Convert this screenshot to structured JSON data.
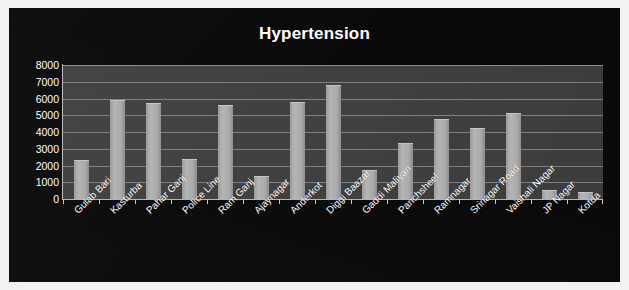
{
  "chart_data": {
    "type": "bar",
    "title": "Hypertension",
    "xlabel": "",
    "ylabel": "",
    "ylim": [
      0,
      8000
    ],
    "ytick_step": 1000,
    "yticks": [
      "8000",
      "7000",
      "6000",
      "5000",
      "4000",
      "3000",
      "2000",
      "1000",
      "0"
    ],
    "grid": true,
    "legend": "none",
    "categories": [
      "Gulab Bari",
      "Kasturba",
      "Pahar Ganj",
      "Police Line",
      "Ram Ganj",
      "Ajaynagar",
      "Anderkot",
      "Diggi Baazar",
      "Gaddi Maliyan",
      "Panchsheel",
      "Ramnagar",
      "Srinagar Road",
      "Vaishali Nagar",
      "JP Nagar",
      "Kotda"
    ],
    "values": [
      2300,
      5920,
      5760,
      2380,
      5640,
      1350,
      5790,
      6780,
      1720,
      3340,
      4790,
      4250,
      5150,
      520,
      430
    ]
  },
  "style": {
    "page_background": "#f2f2f0",
    "canvas_background": "#0a0a0a",
    "plot_background": "#3e3e3e",
    "gridline_color": "#8d8d8d",
    "bar_color": "#a6a6a6",
    "text_color": "#ffffff",
    "axis_color": "#bdbdbd"
  }
}
